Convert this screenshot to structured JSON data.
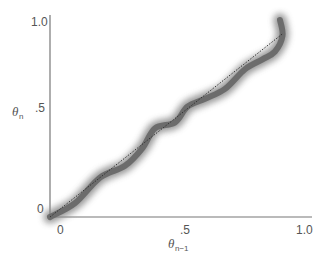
{
  "chart_data": {
    "type": "line",
    "title": "",
    "xlabel": "θ_{n-1}",
    "ylabel": "θ_n",
    "xlim": [
      0,
      1.0
    ],
    "ylim": [
      0,
      1.0
    ],
    "grid": false,
    "legend": null,
    "x_ticks": [
      "0",
      ".5",
      "1.0"
    ],
    "y_ticks": [
      "0",
      ".5",
      "1.0"
    ],
    "series": [
      {
        "name": "return map (blurred curve)",
        "style": "thick blurred gray",
        "x": [
          0.0,
          0.1,
          0.2,
          0.3,
          0.37,
          0.42,
          0.5,
          0.55,
          0.62,
          0.7,
          0.78,
          0.85,
          0.9,
          0.93,
          0.92
        ],
        "y": [
          0.0,
          0.07,
          0.2,
          0.26,
          0.35,
          0.45,
          0.48,
          0.56,
          0.6,
          0.65,
          0.75,
          0.8,
          0.84,
          0.92,
          1.0
        ]
      },
      {
        "name": "identity line",
        "style": "dotted",
        "x": [
          0.0,
          0.93
        ],
        "y": [
          0.0,
          0.93
        ]
      }
    ]
  },
  "labels": {
    "y_axis_symbol": "θ",
    "y_axis_sub": "n",
    "x_axis_symbol": "θ",
    "x_axis_sub": "n−1",
    "y_tick_top": "1.0",
    "y_tick_mid": ".5",
    "y_tick_zero": "0",
    "x_tick_zero": "0",
    "x_tick_mid": ".5",
    "x_tick_right": "1.0"
  },
  "colors": {
    "curve": "#666666",
    "axis": "#777777",
    "identity": "#333333"
  }
}
